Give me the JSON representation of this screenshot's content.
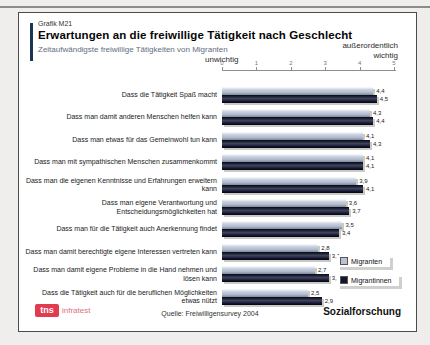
{
  "slide": {
    "graph_id": "Grafik M21",
    "title": "Erwartungen an die freiwillige Tätigkeit nach Geschlecht",
    "subtitle": "Zeitaufwändigste freiwillige Tätigkeiten von Migranten",
    "axis_left_label": "unwichtig",
    "axis_right_label_line1": "außerordentlich",
    "axis_right_label_line2": "wichtig",
    "source": "Quelle: Freiwilligensurvey 2004",
    "footer_right": "Sozialforschung",
    "logo_text": "tns",
    "logo_subtext": "infratest",
    "accent_color": "#1c3557",
    "logo_color": "#e23a4e"
  },
  "chart_data": {
    "type": "bar",
    "orientation": "horizontal",
    "title": "Erwartungen an die freiwillige Tätigkeit nach Geschlecht",
    "subtitle": "Zeitaufwändigste freiwillige Tätigkeiten von Migranten",
    "xlim": [
      0,
      5
    ],
    "ticks": [
      "0",
      "1",
      "2",
      "3",
      "4",
      "5"
    ],
    "axis_annotations": {
      "left": "unwichtig",
      "right": "außerordentlich wichtig"
    },
    "grid": false,
    "legend_position": "right-bottom",
    "value_label_decimal": "comma",
    "categories": [
      "Dass die Tätigkeit Spaß macht",
      "Dass man damit anderen Menschen helfen kann",
      "Dass man etwas für das Gemeinwohl tun kann",
      "Dass man mit sympathischen Menschen zusammenkommt",
      "Dass man die eigenen Kenntnisse und Erfahrungen erweitern kann",
      "Dass man eigene Verantwortung und Entscheidungsmöglichkeiten hat",
      "Dass man für die Tätigkeit auch Anerkennung findet",
      "Dass man damit berechtigte eigene Interessen vertreten kann",
      "Dass man damit eigene Probleme in die Hand nehmen und lösen kann",
      "Dass die Tätigkeit auch für die beruflichen Möglichkeiten etwas nützt"
    ],
    "series": [
      {
        "name": "Migranten",
        "color": "#b8c2d4",
        "values": [
          4.4,
          4.3,
          4.1,
          4.1,
          3.9,
          3.6,
          3.5,
          2.8,
          2.7,
          2.5
        ]
      },
      {
        "name": "Migrantinnen",
        "color": "#14142a",
        "values": [
          4.5,
          4.4,
          4.3,
          4.1,
          4.1,
          3.7,
          3.4,
          3.1,
          3.1,
          2.9
        ]
      }
    ]
  }
}
